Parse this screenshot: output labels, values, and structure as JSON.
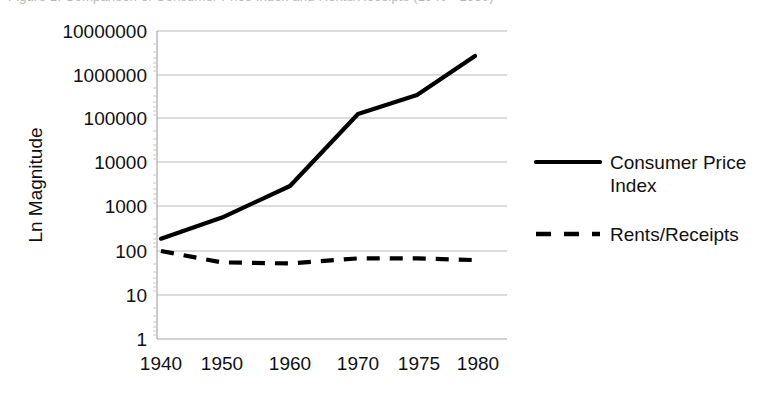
{
  "figure": {
    "title_clipped": "Figure 1. Comparison of Consumer Price Index and Rents/Receipts (1940 - 1980)",
    "title_visible": false
  },
  "axes": {
    "y_axis_title": "Ln Magnitude",
    "y_tick_labels": [
      "10000000",
      "1000000",
      "100000",
      "10000",
      "1000",
      "100",
      "10",
      "1"
    ],
    "x_tick_labels": [
      "1940",
      "1950",
      "1960",
      "1970",
      "1975",
      "1980"
    ]
  },
  "legend": {
    "position": "right",
    "items": [
      {
        "label": "Consumer Price Index",
        "style": "solid",
        "color": "#000000"
      },
      {
        "label": "Rents/Receipts",
        "style": "dashed",
        "color": "#000000"
      }
    ]
  },
  "chart_data": {
    "type": "line",
    "title": "",
    "xlabel": "",
    "ylabel": "Ln Magnitude",
    "x": [
      "1940",
      "1950",
      "1960",
      "1970",
      "1975",
      "1980"
    ],
    "categories": [
      "1940",
      "1950",
      "1960",
      "1970",
      "1975",
      "1980"
    ],
    "yscale": "log",
    "ylim": [
      1,
      10000000
    ],
    "yticks": [
      1,
      10,
      100,
      1000,
      10000,
      100000,
      1000000,
      10000000
    ],
    "grid": true,
    "legend_position": "right",
    "series": [
      {
        "name": "Consumer Price Index",
        "style": "solid",
        "color": "#000000",
        "values": [
          190,
          575,
          3000,
          130000,
          350000,
          2700000
        ]
      },
      {
        "name": "Rents/Receipts",
        "style": "dashed",
        "color": "#000000",
        "values": [
          100,
          55,
          52,
          68,
          68,
          62
        ]
      }
    ]
  }
}
